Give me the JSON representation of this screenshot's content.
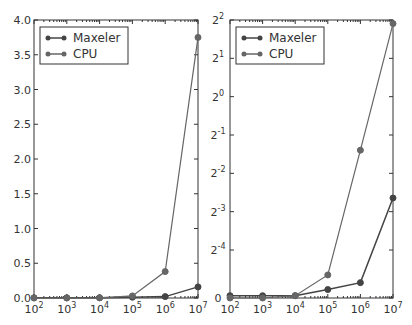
{
  "chart_data": [
    {
      "type": "line",
      "title": "",
      "xlabel": "",
      "ylabel": "",
      "x_scale": "log10",
      "x": [
        100,
        1000,
        10000,
        100000,
        1000000,
        10000000
      ],
      "x_tick_labels": [
        "10^2",
        "10^3",
        "10^4",
        "10^5",
        "10^6",
        "10^7"
      ],
      "ylim": [
        0.0,
        4.0
      ],
      "y_ticks": [
        0.0,
        0.5,
        1.0,
        1.5,
        2.0,
        2.5,
        3.0,
        3.5,
        4.0
      ],
      "y_tick_labels": [
        "0.0",
        "0.5",
        "1.0",
        "1.5",
        "2.0",
        "2.5",
        "3.0",
        "3.5",
        "4.0"
      ],
      "legend_position": "upper left",
      "grid": false,
      "series": [
        {
          "name": "Maxeler",
          "color": "#444444",
          "values": [
            0.003,
            0.003,
            0.003,
            0.011,
            0.02,
            0.16
          ]
        },
        {
          "name": "CPU",
          "color": "#666666",
          "values": [
            0.0,
            0.0,
            0.003,
            0.03,
            0.38,
            3.75
          ]
        }
      ]
    },
    {
      "type": "line",
      "title": "",
      "xlabel": "",
      "ylabel": "",
      "x_scale": "log10",
      "y_scale": "symlog2",
      "x": [
        100,
        1000,
        10000,
        100000,
        1000000,
        10000000
      ],
      "x_tick_labels": [
        "10^2",
        "10^3",
        "10^4",
        "10^5",
        "10^6",
        "10^7"
      ],
      "ylim": [
        0,
        4
      ],
      "y_tick_labels": [
        "0",
        "2^-4",
        "2^-3",
        "2^-2",
        "2^-1",
        "2^0",
        "2^1",
        "2^2"
      ],
      "legend_position": "upper left",
      "grid": false,
      "series": [
        {
          "name": "Maxeler",
          "color": "#444444",
          "values": [
            0.003,
            0.003,
            0.003,
            0.011,
            0.02,
            0.16
          ]
        },
        {
          "name": "CPU",
          "color": "#666666",
          "values": [
            0.0,
            0.0,
            0.003,
            0.03,
            0.38,
            3.75
          ]
        }
      ]
    }
  ],
  "legend": {
    "items": [
      "Maxeler",
      "CPU"
    ]
  },
  "left_axis": {
    "x_ticks": [
      {
        "base": "10",
        "exp": "2"
      },
      {
        "base": "10",
        "exp": "3"
      },
      {
        "base": "10",
        "exp": "4"
      },
      {
        "base": "10",
        "exp": "5"
      },
      {
        "base": "10",
        "exp": "6"
      },
      {
        "base": "10",
        "exp": "7"
      }
    ],
    "y_ticks": [
      "0.0",
      "0.5",
      "1.0",
      "1.5",
      "2.0",
      "2.5",
      "3.0",
      "3.5",
      "4.0"
    ]
  },
  "right_axis": {
    "x_ticks": [
      {
        "base": "10",
        "exp": "2"
      },
      {
        "base": "10",
        "exp": "3"
      },
      {
        "base": "10",
        "exp": "4"
      },
      {
        "base": "10",
        "exp": "5"
      },
      {
        "base": "10",
        "exp": "6"
      },
      {
        "base": "10",
        "exp": "7"
      }
    ],
    "y_ticks": [
      {
        "base": "2",
        "exp": "2"
      },
      {
        "base": "2",
        "exp": "1"
      },
      {
        "base": "2",
        "exp": "0"
      },
      {
        "base": "2",
        "exp": "-1"
      },
      {
        "base": "2",
        "exp": "-2"
      },
      {
        "base": "2",
        "exp": "-3"
      },
      {
        "base": "2",
        "exp": "-4"
      },
      {
        "base": "0",
        "exp": ""
      }
    ]
  }
}
